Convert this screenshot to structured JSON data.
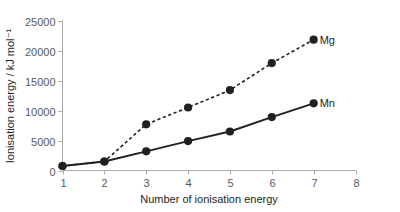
{
  "chart_data": {
    "type": "line",
    "title": "",
    "subtitle": "",
    "xlabel": "Number of ionisation energy",
    "ylabel": "Ionisation energy / kJ mol⁻¹",
    "x": [
      1,
      2,
      3,
      4,
      5,
      6,
      7
    ],
    "xlim": [
      1,
      8
    ],
    "ylim": [
      0,
      25000
    ],
    "xticks": [
      1,
      2,
      3,
      4,
      5,
      6,
      7,
      8
    ],
    "xtick_labels": [
      "1",
      "2",
      "3",
      "4",
      "5",
      "6",
      "7",
      "8"
    ],
    "yticks": [
      0,
      5000,
      10000,
      15000,
      20000,
      25000
    ],
    "ytick_labels": [
      "0",
      "5000",
      "10000",
      "15000",
      "20000",
      "25000"
    ],
    "grid": false,
    "legend_position": "inline-right-end-of-line",
    "series": [
      {
        "name": "Mg",
        "label": "Mg",
        "style": "dashed",
        "marker": "circle",
        "color": "#231f20",
        "values": [
          750,
          1500,
          7700,
          10500,
          13400,
          17900,
          21800
        ]
      },
      {
        "name": "Mn",
        "label": "Mn",
        "style": "solid",
        "marker": "circle",
        "color": "#231f20",
        "values": [
          750,
          1500,
          3200,
          4900,
          6500,
          8900,
          11200
        ]
      }
    ]
  },
  "figure": {
    "background_color": "#ffffff",
    "axis_color": "#a7a9ac",
    "text_color": "#231f20",
    "tick_text_color": "#58595b"
  }
}
